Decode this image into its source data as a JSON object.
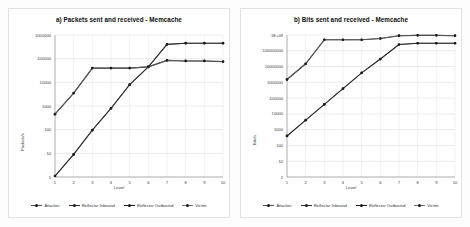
{
  "figure": {
    "background": "#fdfdfd",
    "panel_border": "#e2e2e2"
  },
  "legend": {
    "items": [
      {
        "label": "Attacker",
        "color": "#4f4f4f"
      },
      {
        "label": "Reflector Inbound",
        "color": "#2b2b2b"
      },
      {
        "label": "Reflector Outbound",
        "color": "#1a1a1a"
      },
      {
        "label": "Victim",
        "color": "#6e6e6e"
      }
    ]
  },
  "chart_data": [
    {
      "type": "line",
      "id": "packets",
      "title": "a) Packets sent and received - Memcache",
      "xlabel": "Level",
      "ylabel": "Packets/s",
      "x": [
        1,
        2,
        3,
        4,
        5,
        6,
        7,
        8,
        9,
        10
      ],
      "categories": [
        "1",
        "2",
        "3",
        "4",
        "5",
        "6",
        "7",
        "8",
        "9",
        "10"
      ],
      "yscale": "log",
      "ylim": [
        1,
        1000000
      ],
      "yticks": [
        1,
        10,
        100,
        1000,
        10000,
        100000,
        1000000
      ],
      "ytick_labels": [
        "1",
        "10",
        "100",
        "1000",
        "10000",
        "100000",
        "1000000"
      ],
      "grid": true,
      "legend_position": "bottom",
      "series": [
        {
          "name": "Attacker",
          "color": "#4f4f4f",
          "values": [
            1.1,
            9,
            95,
            800,
            8000,
            45000,
            400000,
            450000,
            450000,
            450000
          ]
        },
        {
          "name": "Reflector Inbound",
          "color": "#2b2b2b",
          "values": [
            1.1,
            9,
            95,
            800,
            8000,
            45000,
            400000,
            450000,
            450000,
            450000
          ]
        },
        {
          "name": "Reflector Outbound",
          "color": "#1a1a1a",
          "values": [
            450,
            3500,
            40000,
            40000,
            40000,
            45000,
            85000,
            80000,
            80000,
            75000
          ]
        },
        {
          "name": "Victim",
          "color": "#6e6e6e",
          "values": [
            450,
            3500,
            40000,
            40000,
            40000,
            45000,
            85000,
            80000,
            80000,
            75000
          ]
        }
      ]
    },
    {
      "type": "line",
      "id": "bits",
      "title": "b) Bits sent and received - Memcache",
      "xlabel": "Level",
      "ylabel": "Bits/s",
      "x": [
        1,
        2,
        3,
        4,
        5,
        6,
        7,
        8,
        9,
        10
      ],
      "categories": [
        "1",
        "2",
        "3",
        "4",
        "5",
        "6",
        "7",
        "8",
        "9",
        "10"
      ],
      "yscale": "log",
      "ylim": [
        1,
        1000000000
      ],
      "yticks": [
        1,
        10,
        100,
        1000,
        10000,
        100000,
        1000000,
        10000000,
        100000000,
        1000000000
      ],
      "ytick_labels": [
        "1",
        "10",
        "100",
        "1000",
        "10000",
        "100000",
        "1000000",
        "10000000",
        "100000000",
        "1E+09"
      ],
      "grid": true,
      "legend_position": "bottom",
      "series": [
        {
          "name": "Attacker",
          "color": "#4f4f4f",
          "values": [
            400,
            4000,
            40000,
            400000,
            4000000,
            30000000,
            250000000,
            300000000,
            300000000,
            300000000
          ]
        },
        {
          "name": "Reflector Inbound",
          "color": "#2b2b2b",
          "values": [
            400,
            4000,
            40000,
            400000,
            4000000,
            30000000,
            250000000,
            300000000,
            300000000,
            300000000
          ]
        },
        {
          "name": "Reflector Outbound",
          "color": "#1a1a1a",
          "values": [
            1500000,
            15000000,
            500000000,
            500000000,
            500000000,
            600000000,
            900000000,
            950000000,
            950000000,
            900000000
          ]
        },
        {
          "name": "Victim",
          "color": "#6e6e6e",
          "values": [
            1500000,
            15000000,
            500000000,
            500000000,
            500000000,
            600000000,
            900000000,
            950000000,
            950000000,
            900000000
          ]
        }
      ]
    }
  ]
}
